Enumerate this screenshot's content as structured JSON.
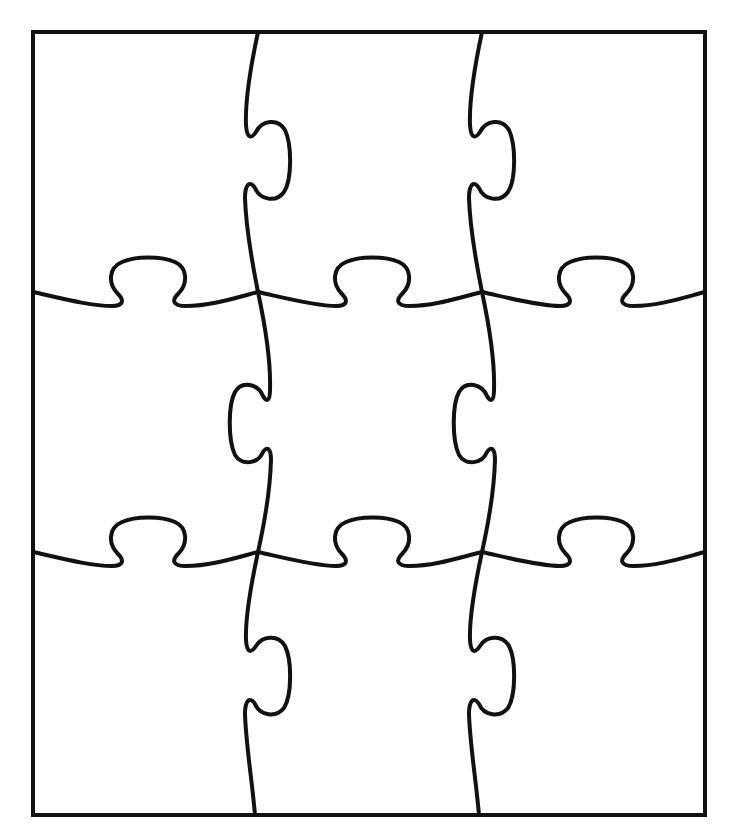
{
  "grid": {
    "rows": 3,
    "cols": 3
  },
  "colors": {
    "stroke": "#111111",
    "background": "#ffffff"
  },
  "frame": {
    "x": 33,
    "y": 32,
    "width": 672,
    "height": 783
  },
  "pieces": [
    {
      "id": "r1c1",
      "label": "Piece row 1 column 1"
    },
    {
      "id": "r1c2",
      "label": "Piece row 1 column 2"
    },
    {
      "id": "r1c3",
      "label": "Piece row 1 column 3"
    },
    {
      "id": "r2c1",
      "label": "Piece row 2 column 1"
    },
    {
      "id": "r2c2",
      "label": "Piece row 2 column 2"
    },
    {
      "id": "r2c3",
      "label": "Piece row 2 column 3"
    },
    {
      "id": "r3c1",
      "label": "Piece row 3 column 1"
    },
    {
      "id": "r3c2",
      "label": "Piece row 3 column 2"
    },
    {
      "id": "r3c3",
      "label": "Piece row 3 column 3"
    }
  ]
}
